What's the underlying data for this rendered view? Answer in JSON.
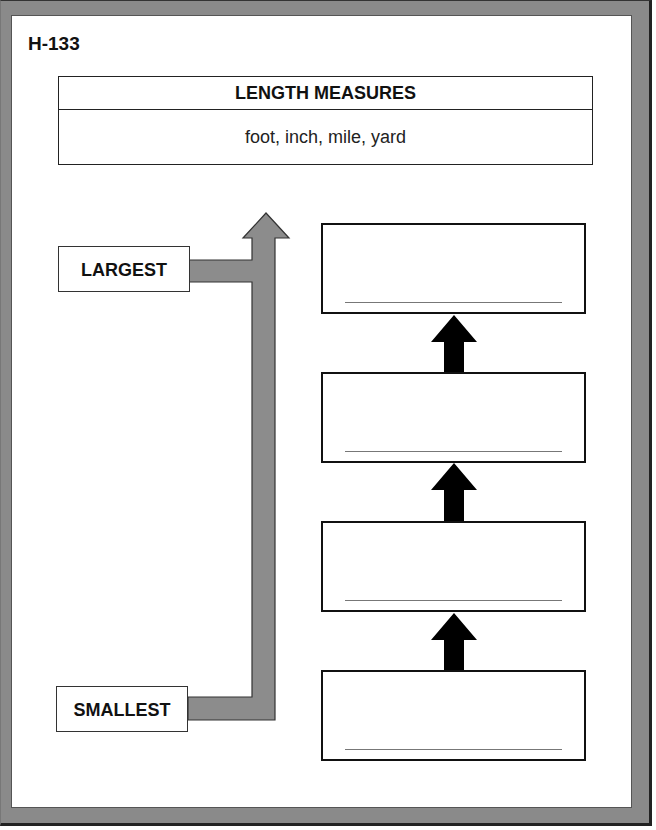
{
  "worksheet": {
    "code": "H-133",
    "title": "LENGTH MEASURES",
    "word_bank": "foot, inch, mile, yard",
    "scale_labels": {
      "top": "LARGEST",
      "bottom": "SMALLEST"
    },
    "answer_boxes": [
      {
        "position": 1,
        "value": ""
      },
      {
        "position": 2,
        "value": ""
      },
      {
        "position": 3,
        "value": ""
      },
      {
        "position": 4,
        "value": ""
      }
    ],
    "colors": {
      "frame": "#8a8a8a",
      "scale_arrow": "#8c8c8c",
      "step_arrow": "#000000"
    }
  }
}
